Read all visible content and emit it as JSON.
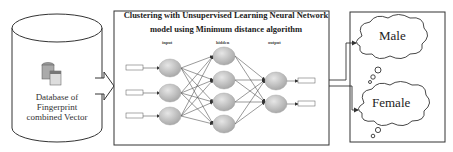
{
  "database": {
    "label": "Database of Fingerprint combined Vector",
    "icon": "database-icon"
  },
  "network": {
    "title": "Clustering with Unsupervised Learning Neural Network model using Minimum distance algorithm",
    "layers": {
      "input": "input",
      "hidden": "hidden",
      "output": "output"
    }
  },
  "outputs": [
    {
      "label": "Male"
    },
    {
      "label": "Female"
    }
  ],
  "colors": {
    "line": "#333333",
    "node": "#bdbdbd",
    "background": "#ffffff"
  }
}
